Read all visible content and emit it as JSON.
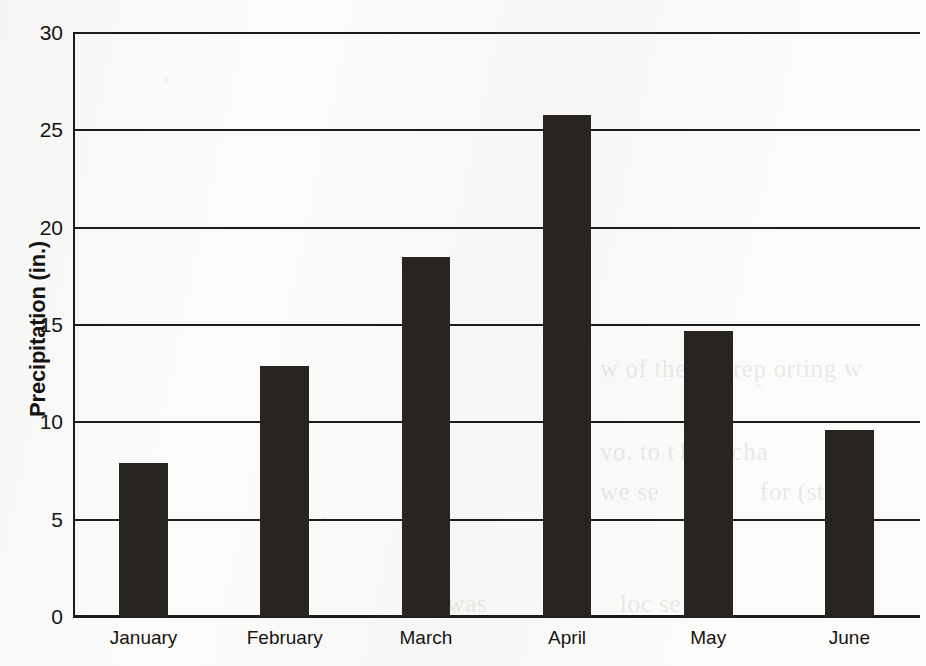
{
  "chart_data": {
    "type": "bar",
    "title": "",
    "xlabel": "",
    "ylabel": "Precipitation (in.)",
    "categories": [
      "January",
      "February",
      "March",
      "April",
      "May",
      "June"
    ],
    "values": [
      7.9,
      12.9,
      18.5,
      25.8,
      14.7,
      9.6
    ],
    "ylim": [
      0,
      30
    ],
    "yticks": [
      0,
      5,
      10,
      15,
      20,
      25,
      30
    ],
    "ytick_labels": [
      "0",
      "5",
      "10",
      "15",
      "20",
      "25",
      "30"
    ],
    "grid": true,
    "legend": false,
    "bar_color": "#272422",
    "axis_color": "#1d1b19",
    "background": "#fbfbf9"
  },
  "ghost_text": [
    {
      "text": "w of the",
      "x": 600,
      "y": 355
    },
    {
      "text": "m rep orting w",
      "x": 706,
      "y": 355
    },
    {
      "text": "vo. to t",
      "x": 600,
      "y": 438
    },
    {
      "text": "he n   cha",
      "x": 680,
      "y": 438
    },
    {
      "text": "we    se",
      "x": 600,
      "y": 478
    },
    {
      "text": "for (st",
      "x": 760,
      "y": 478
    },
    {
      "text": "loc    se  cm",
      "x": 620,
      "y": 590
    },
    {
      "text": "he was",
      "x": 415,
      "y": 590
    }
  ]
}
